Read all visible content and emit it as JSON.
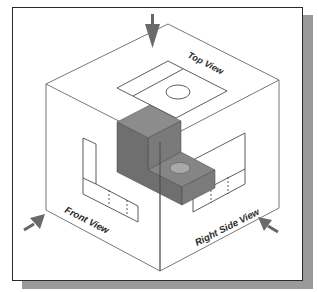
{
  "figure": {
    "labels": {
      "top_view": "Top View",
      "front_view": "Front View",
      "right_side_view": "Right Side View"
    },
    "colors": {
      "background": "#ffffff",
      "frame_border": "#2a2a2a",
      "frame_shadow": "#9a9a9a",
      "box_edges": "#555555",
      "solid_top": "#8a8a8a",
      "solid_front": "#6f6f6f",
      "solid_side": "#7d7d7d",
      "arrow": "#6a6a6a"
    },
    "arrows": [
      {
        "name": "top-view-direction-arrow",
        "direction": "down"
      },
      {
        "name": "front-view-direction-arrow",
        "direction": "down-left"
      },
      {
        "name": "right-view-direction-arrow",
        "direction": "down-right"
      }
    ]
  }
}
